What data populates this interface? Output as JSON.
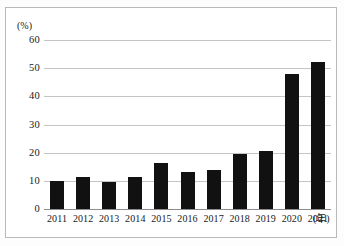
{
  "chart_data": {
    "type": "bar",
    "title": "",
    "xlabel": "(年)",
    "ylabel": "(%)",
    "ylim": [
      0,
      60
    ],
    "yticks": [
      0,
      10,
      20,
      30,
      40,
      50,
      60
    ],
    "ytick_labels": [
      "0",
      "10",
      "20",
      "30",
      "40",
      "50",
      "60"
    ],
    "grid": true,
    "legend": "none",
    "categories": [
      "2011",
      "2012",
      "2013",
      "2014",
      "2015",
      "2016",
      "2017",
      "2018",
      "2019",
      "2020",
      "2021"
    ],
    "values": [
      10.0,
      11.5,
      9.5,
      11.5,
      16.2,
      13.3,
      14.0,
      19.4,
      20.6,
      47.8,
      52.3
    ],
    "bar_color": "#111111",
    "grid_color": "#c4c4c4",
    "axis_color": "#8d8d8d"
  },
  "axes": {
    "y_unit_label": "(%)",
    "x_unit_label": "(年)"
  }
}
